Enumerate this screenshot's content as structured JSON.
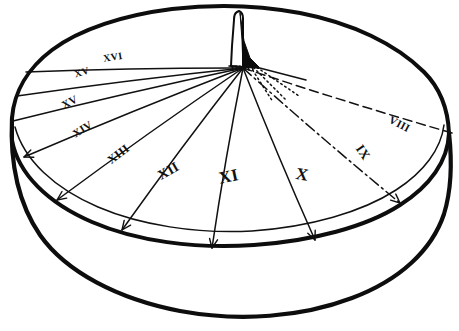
{
  "figure": {
    "style": "hand-drawn ink line illustration",
    "background_color": "#ffffff",
    "ink_color": "#111111",
    "gnomon": {
      "name": "gnomon",
      "shape": "triangular blade",
      "fill_color": "#0a0a0a",
      "position": "top-center of dial face"
    },
    "hour_lines": [
      {
        "label": "XVI",
        "style": "solid",
        "side": "left",
        "label_x": 113,
        "label_y": 58,
        "label_rotation": -9,
        "label_size": 10,
        "tip_x": 26,
        "tip_y": 72,
        "arrow": false
      },
      {
        "label": "XV",
        "style": "solid",
        "side": "left",
        "label_x": 82,
        "label_y": 73,
        "label_rotation": -17,
        "label_size": 10,
        "tip_x": 17,
        "tip_y": 96,
        "arrow": false
      },
      {
        "label": "XV",
        "style": "solid",
        "side": "left",
        "label_x": 70,
        "label_y": 103,
        "label_rotation": -28,
        "label_size": 11,
        "tip_x": 13,
        "tip_y": 121,
        "arrow": false
      },
      {
        "label": "XIV",
        "style": "solid",
        "side": "left",
        "label_x": 83,
        "label_y": 130,
        "label_rotation": -32,
        "label_size": 11,
        "tip_x": 24,
        "tip_y": 157,
        "arrow": true
      },
      {
        "label": "XIII",
        "style": "solid",
        "side": "left",
        "label_x": 119,
        "label_y": 155,
        "label_rotation": -38,
        "label_size": 12,
        "tip_x": 57,
        "tip_y": 200,
        "arrow": true
      },
      {
        "label": "XII",
        "style": "solid",
        "side": "left",
        "label_x": 169,
        "label_y": 172,
        "label_rotation": -30,
        "label_size": 14,
        "tip_x": 122,
        "tip_y": 230,
        "arrow": true
      },
      {
        "label": "XI",
        "style": "solid",
        "side": "center",
        "label_x": 229,
        "label_y": 178,
        "label_rotation": -12,
        "label_size": 17,
        "tip_x": 212,
        "tip_y": 248,
        "arrow": true
      },
      {
        "label": "X",
        "style": "solid",
        "side": "right",
        "label_x": 302,
        "label_y": 176,
        "label_rotation": 10,
        "label_size": 17,
        "tip_x": 315,
        "tip_y": 240,
        "arrow": true
      },
      {
        "label": "IX",
        "style": "dash-dot",
        "side": "right",
        "label_x": 362,
        "label_y": 153,
        "label_rotation": 56,
        "label_size": 13,
        "tip_x": 400,
        "tip_y": 203,
        "arrow": true
      },
      {
        "label": "VIII",
        "style": "dashed",
        "side": "right",
        "label_x": 399,
        "label_y": 125,
        "label_rotation": 28,
        "label_size": 11,
        "tip_x": 452,
        "tip_y": 133,
        "arrow": false
      }
    ],
    "shadow_rays": {
      "name": "dotted shadow construction rays",
      "style": "dotted",
      "count": 3
    }
  }
}
